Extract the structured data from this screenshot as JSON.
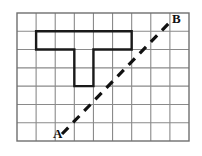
{
  "figure": {
    "background_color": "#ffffff",
    "width": 202,
    "height": 156
  },
  "grid": {
    "columns": 9,
    "rows": 7,
    "x0": 17,
    "y0": 13,
    "x1": 189,
    "y1": 141,
    "cell_width": 19.11,
    "cell_height": 18.29,
    "line_color": "#8a8a8a",
    "line_width": 1.1,
    "border_color": "#6f6f6f",
    "border_width": 1.4
  },
  "shape": {
    "name": "t-shaped-polygon",
    "stroke_color": "#1a1a1a",
    "stroke_width": 2.4,
    "fill": "none",
    "cells_description": "Horizontal bar across columns 1-6 of row 1, stem in columns 3-4 of rows 2-3",
    "vertices_grid": [
      [
        1,
        1
      ],
      [
        6,
        1
      ],
      [
        6,
        2
      ],
      [
        4,
        2
      ],
      [
        4,
        4
      ],
      [
        3,
        4
      ],
      [
        3,
        2
      ],
      [
        1,
        2
      ]
    ]
  },
  "segment": {
    "name": "dashed-segment-ab",
    "stroke_color": "#111111",
    "stroke_width": 3.2,
    "dash_pattern": "9 7",
    "start": {
      "x": 62,
      "y": 134
    },
    "end": {
      "x": 171,
      "y": 21
    }
  },
  "labels": {
    "point_a": "A",
    "point_b": "B",
    "color": "#111111"
  }
}
